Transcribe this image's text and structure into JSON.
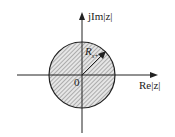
{
  "diagram": {
    "type": "z-plane region of convergence",
    "y_axis_label": "jIm|z|",
    "x_axis_label": "Re|z|",
    "origin_label": "0",
    "radius_label": "R",
    "radius_subscript": "x+",
    "region": "inside circle (hatched)",
    "colors": {
      "line": "#222222",
      "hatch": "#555555",
      "fill": "#e6e6e6"
    }
  }
}
